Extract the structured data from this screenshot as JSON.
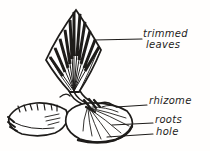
{
  "labels": {
    "trimmed_leaves_line1": "trimmed",
    "trimmed_leaves_line2": "leaves",
    "rhizome": "rhizome",
    "roots": "roots",
    "hole": "hole"
  },
  "colors": {
    "ink": "#1e1c1a",
    "paper": "#fffefd"
  }
}
